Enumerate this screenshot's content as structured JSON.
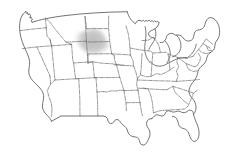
{
  "figure": {
    "title": "Map of the United States",
    "width": 234,
    "height": 157,
    "background_color": "#ffffff"
  },
  "styles": {
    "national_outline_color": "#5a5a5a",
    "state_border_color": "#6b6b6b",
    "state_border_style": "dash-dot",
    "highlight_color": "#c9c9c9",
    "highlight_color_core": "#bdbdbd",
    "lake_outline_color": "#5a5a5a"
  },
  "highlight": {
    "name": "northern-plains-highlight",
    "label": "Highlighted region",
    "region": "Northern Plains (Montana / Wyoming / Dakotas border area)",
    "fill": "#c9c9c9",
    "opacity": 0.75
  },
  "features": {
    "national_outline_label": "United States national outline",
    "state_borders_label": "State boundaries",
    "great_lakes_label": "Great Lakes",
    "coastline_label": "Coastline"
  },
  "regions": [
    {
      "id": "west-coast",
      "label": "West Coast"
    },
    {
      "id": "mountain-west",
      "label": "Mountain West"
    },
    {
      "id": "great-plains",
      "label": "Great Plains"
    },
    {
      "id": "midwest",
      "label": "Midwest"
    },
    {
      "id": "south",
      "label": "South"
    },
    {
      "id": "northeast",
      "label": "Northeast"
    }
  ]
}
